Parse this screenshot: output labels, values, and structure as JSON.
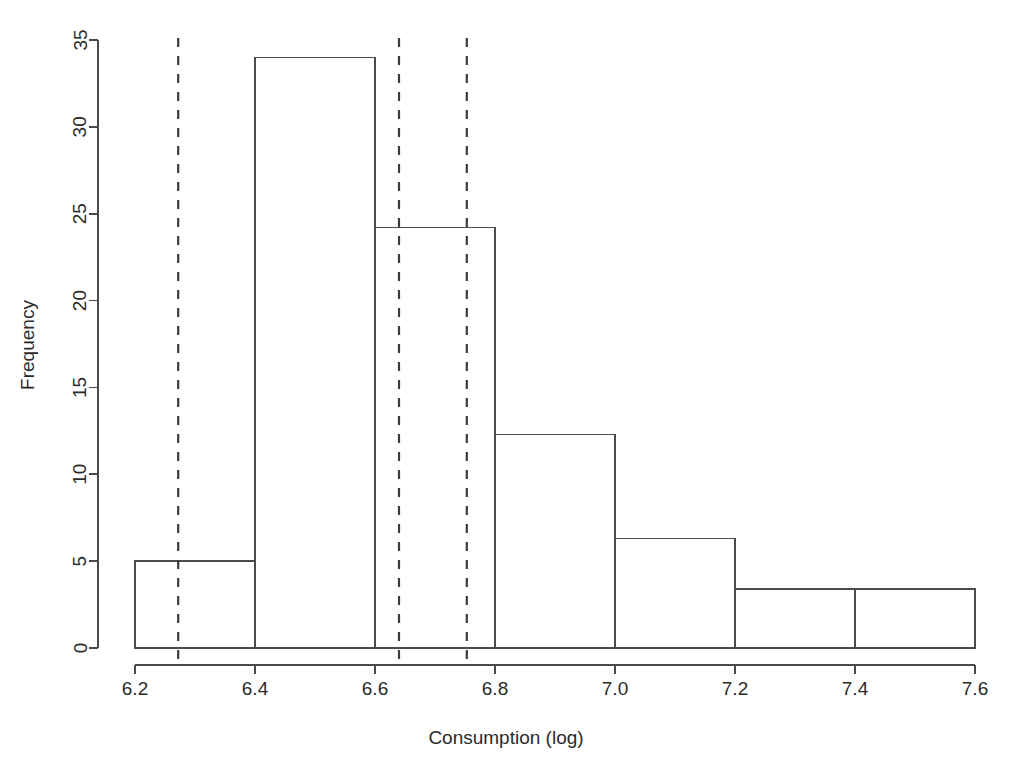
{
  "chart_data": {
    "type": "bar",
    "title": "",
    "subtitle": "",
    "xlabel": "Consumption (log)",
    "ylabel": "Frequency",
    "xlim": [
      6.2,
      7.6
    ],
    "ylim": [
      0,
      35
    ],
    "grid": false,
    "legend": null,
    "bin_width": 0.2,
    "bin_edges": [
      6.2,
      6.4,
      6.6,
      6.8,
      7.0,
      7.2,
      7.4,
      7.6
    ],
    "categories": [
      "6.2-6.4",
      "6.4-6.6",
      "6.6-6.8",
      "6.8-7.0",
      "7.0-7.2",
      "7.2-7.4",
      "7.4-7.6"
    ],
    "values": [
      5.0,
      34.0,
      24.2,
      12.3,
      6.3,
      3.4,
      3.4
    ],
    "xticks": [
      6.2,
      6.4,
      6.6,
      6.8,
      7.0,
      7.2,
      7.4,
      7.6
    ],
    "xtick_labels": [
      "6.2",
      "6.4",
      "6.6",
      "6.8",
      "7.0",
      "7.2",
      "7.4",
      "7.6"
    ],
    "yticks": [
      0,
      5,
      10,
      15,
      20,
      25,
      30,
      35
    ],
    "ytick_labels": [
      "0",
      "5",
      "10",
      "15",
      "20",
      "25",
      "30",
      "35"
    ],
    "annotations": [
      {
        "name": "reference-line-1",
        "type": "vline",
        "x": 6.272,
        "style": "dashed"
      },
      {
        "name": "reference-line-2",
        "type": "vline",
        "x": 6.64,
        "style": "dashed"
      },
      {
        "name": "reference-line-3",
        "type": "vline",
        "x": 6.753,
        "style": "dashed"
      }
    ],
    "colors": {
      "bar_stroke": "#4c4c4c",
      "bar_fill": "none",
      "axis": "#4a4a4a",
      "reference_line": "#3c3c3c",
      "text": "#2b2b2b",
      "background": "#ffffff"
    }
  }
}
